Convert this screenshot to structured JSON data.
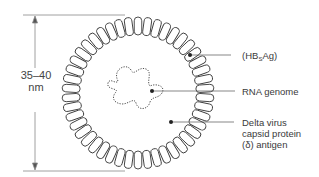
{
  "diagram": {
    "dimension": {
      "value": "35–40",
      "unit": "nm"
    },
    "labels": [
      {
        "id": "surface-antigen",
        "prefix": "(HB",
        "sub": "S",
        "suffix": "Ag)"
      },
      {
        "id": "rna-genome",
        "text": "RNA genome"
      },
      {
        "id": "delta-antigen",
        "lines": [
          "Delta virus",
          "capsid protein",
          "(δ) antigen"
        ]
      }
    ],
    "colors": {
      "stroke": "#3a3a3a",
      "background": "#ffffff",
      "dimension_line": "#888888"
    }
  }
}
